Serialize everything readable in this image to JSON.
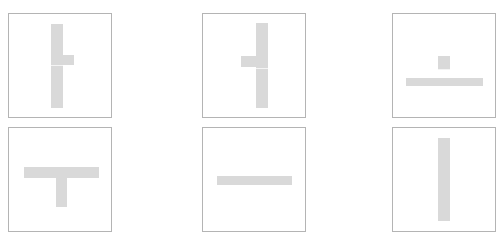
{
  "colors": {
    "tile_border": "#b4b4b4",
    "bar_fill": "#d9d9d9",
    "background": "#ffffff"
  },
  "tiles": [
    {
      "id": "tile-1",
      "shape": "vertical-bar-with-right-nub",
      "x": 8,
      "y": 13,
      "w": 104,
      "h": 105,
      "bars": [
        {
          "x": 42,
          "y": 10,
          "w": 12,
          "h": 84
        },
        {
          "x": 54,
          "y": 41,
          "w": 11,
          "h": 10
        }
      ],
      "gaps": [
        {
          "x": 42,
          "y": 51,
          "w": 12,
          "h": 1
        }
      ]
    },
    {
      "id": "tile-2",
      "shape": "vertical-bar-with-left-nub",
      "x": 202,
      "y": 13,
      "w": 104,
      "h": 105,
      "bars": [
        {
          "x": 53,
          "y": 9,
          "w": 12,
          "h": 85
        },
        {
          "x": 38,
          "y": 42,
          "w": 15,
          "h": 11
        }
      ],
      "gaps": [
        {
          "x": 53,
          "y": 54,
          "w": 12,
          "h": 1
        }
      ]
    },
    {
      "id": "tile-3",
      "shape": "inverted-t",
      "x": 392,
      "y": 13,
      "w": 104,
      "h": 105,
      "bars": [
        {
          "x": 45,
          "y": 42,
          "w": 12,
          "h": 14
        },
        {
          "x": 13,
          "y": 64,
          "w": 77,
          "h": 8
        }
      ],
      "gaps": [
        {
          "x": 45,
          "y": 55,
          "w": 12,
          "h": 1
        }
      ]
    },
    {
      "id": "tile-4",
      "shape": "t-shape",
      "x": 8,
      "y": 127,
      "w": 104,
      "h": 105,
      "bars": [
        {
          "x": 15,
          "y": 39,
          "w": 75,
          "h": 11
        },
        {
          "x": 47,
          "y": 50,
          "w": 11,
          "h": 29
        }
      ],
      "gaps": []
    },
    {
      "id": "tile-5",
      "shape": "horizontal-bar",
      "x": 202,
      "y": 127,
      "w": 104,
      "h": 105,
      "bars": [
        {
          "x": 14,
          "y": 48,
          "w": 75,
          "h": 9
        }
      ],
      "gaps": []
    },
    {
      "id": "tile-6",
      "shape": "vertical-bar",
      "x": 392,
      "y": 127,
      "w": 104,
      "h": 105,
      "bars": [
        {
          "x": 45,
          "y": 10,
          "w": 12,
          "h": 83
        }
      ],
      "gaps": []
    }
  ]
}
